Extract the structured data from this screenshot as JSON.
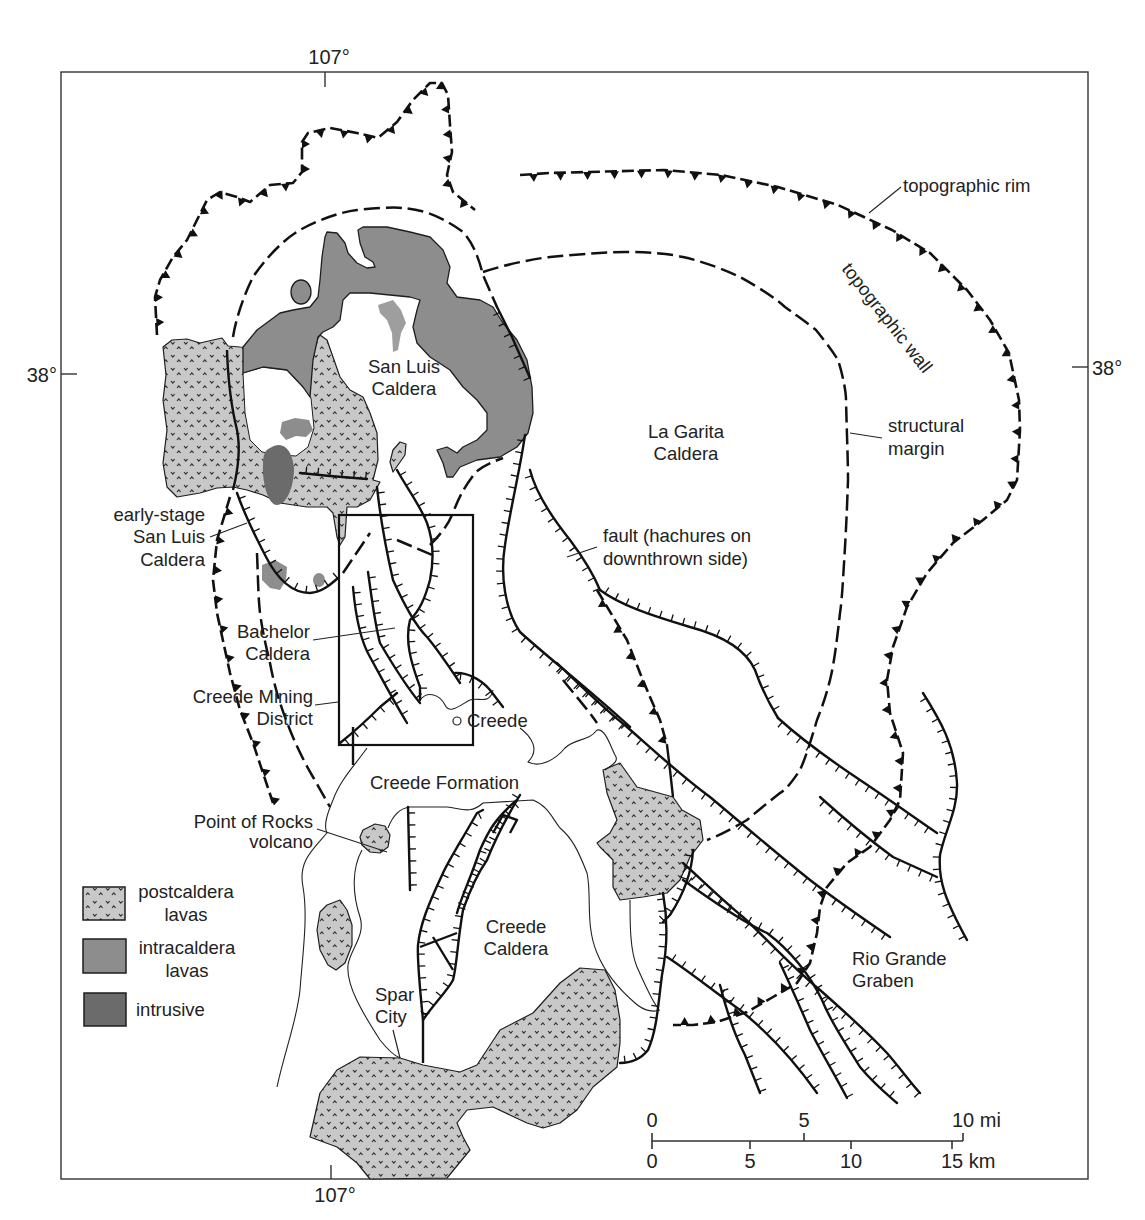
{
  "coordinates": {
    "longitude_top": "107°",
    "longitude_bottom": "107°",
    "latitude_left": "38°",
    "latitude_right": "38°"
  },
  "features": {
    "san_luis_caldera": [
      "San Luis",
      "Caldera"
    ],
    "la_garita_caldera": [
      "La Garita",
      "Caldera"
    ],
    "early_stage_san_luis_caldera": [
      "early-stage",
      "San Luis",
      "Caldera"
    ],
    "bachelor_caldera": [
      "Bachelor",
      "Caldera"
    ],
    "creede_mining_district": [
      "Creede Mining",
      "District"
    ],
    "creede_town": "Creede",
    "creede_formation": "Creede Formation",
    "point_of_rocks_volcano": [
      "Point of Rocks",
      "volcano"
    ],
    "creede_caldera": [
      "Creede",
      "Caldera"
    ],
    "spar_city": [
      "Spar",
      "City"
    ],
    "rio_grande_graben": [
      "Rio Grande",
      "Graben"
    ]
  },
  "annotations": {
    "topographic_rim": "topographic rim",
    "topographic_wall": "topographic wall",
    "structural_margin": [
      "structural",
      "margin"
    ],
    "fault": [
      "fault (hachures on",
      "downthrown side)"
    ]
  },
  "legend": {
    "items": [
      {
        "label": [
          "postcaldera",
          "lavas"
        ],
        "color": "#c8c8c8",
        "pattern": "dotted"
      },
      {
        "label": [
          "intracaldera",
          "lavas"
        ],
        "color": "#8d8d8d"
      },
      {
        "label": [
          "intrusive"
        ],
        "color": "#6b6b6b"
      }
    ]
  },
  "scale_bar": {
    "miles_labels": [
      "0",
      "5",
      "10 mi"
    ],
    "km_labels": [
      "0",
      "5",
      "10",
      "15 km"
    ]
  }
}
